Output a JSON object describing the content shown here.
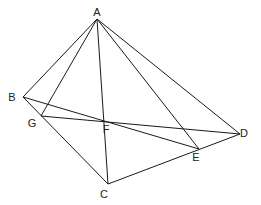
{
  "diagram": {
    "type": "geometry-figure",
    "points": {
      "A": {
        "label": "A",
        "x": 97,
        "y": 19,
        "lx": 97,
        "ly": 16
      },
      "B": {
        "label": "B",
        "x": 23,
        "y": 97,
        "lx": 12,
        "ly": 101
      },
      "G": {
        "label": "G",
        "x": 41,
        "y": 116,
        "lx": 32,
        "ly": 127
      },
      "F": {
        "label": "F",
        "x": 104,
        "y": 121,
        "lx": 106,
        "ly": 133
      },
      "D": {
        "label": "D",
        "x": 240,
        "y": 134,
        "lx": 244,
        "ly": 137
      },
      "E": {
        "label": "E",
        "x": 199,
        "y": 149,
        "lx": 196,
        "ly": 161
      },
      "C": {
        "label": "C",
        "x": 108,
        "y": 184,
        "lx": 104,
        "ly": 198
      }
    },
    "segments": [
      [
        "A",
        "B"
      ],
      [
        "A",
        "G"
      ],
      [
        "A",
        "C"
      ],
      [
        "A",
        "E"
      ],
      [
        "A",
        "D"
      ],
      [
        "B",
        "C"
      ],
      [
        "B",
        "E"
      ],
      [
        "G",
        "D"
      ],
      [
        "C",
        "D"
      ]
    ],
    "colors": {
      "line": "#1a1a1a",
      "label": "#222222",
      "background": "#ffffff"
    }
  }
}
